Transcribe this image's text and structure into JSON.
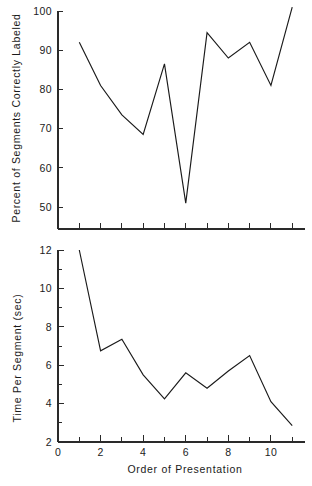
{
  "figure": {
    "background_color": "#ffffff",
    "line_color": "#1a1a1a",
    "axis_color": "#2a2a2a",
    "xlabel": "Order of Presentation"
  },
  "chart_data": [
    {
      "type": "line",
      "title": "",
      "xlabel": "",
      "ylabel": "Percent of Segments Correctly Labeled",
      "xlim": [
        0,
        11.6
      ],
      "ylim": [
        45,
        101.5
      ],
      "grid": false,
      "legend": "none",
      "x": [
        1,
        2,
        3,
        4,
        5,
        6,
        7,
        8,
        9,
        10,
        11
      ],
      "values": [
        92,
        81,
        73.5,
        68.5,
        86.5,
        51,
        94.5,
        88,
        92,
        81,
        101
      ],
      "ytick_labels": [
        "50",
        "60",
        "70",
        "80",
        "90",
        "100"
      ],
      "ytick_values": [
        50,
        60,
        70,
        80,
        90,
        100
      ],
      "xtick_values": [
        1,
        2,
        3,
        4,
        5,
        6,
        7,
        8,
        9,
        10,
        11
      ],
      "xtick_labels": [
        "",
        "",
        "",
        "",
        "",
        "",
        "",
        "",
        "",
        "",
        ""
      ]
    },
    {
      "type": "line",
      "title": "",
      "xlabel": "Order of Presentation",
      "ylabel": "Time Per Segment (sec)",
      "xlim": [
        0,
        11.6
      ],
      "ylim": [
        2,
        12
      ],
      "grid": false,
      "legend": "none",
      "x": [
        1,
        2,
        3,
        4,
        5,
        6,
        7,
        8,
        9,
        10,
        11
      ],
      "values": [
        12,
        6.75,
        7.35,
        5.5,
        4.25,
        5.6,
        4.8,
        5.7,
        6.5,
        4.1,
        2.85
      ],
      "ytick_labels": [
        "2",
        "4",
        "6",
        "8",
        "10",
        "12"
      ],
      "ytick_values": [
        2,
        4,
        6,
        8,
        10,
        12
      ],
      "xtick_values": [
        0,
        1,
        2,
        3,
        4,
        5,
        6,
        7,
        8,
        9,
        10,
        11
      ],
      "xtick_labels": [
        "0",
        "",
        "2",
        "",
        "4",
        "",
        "6",
        "",
        "8",
        "",
        "10",
        ""
      ]
    }
  ]
}
